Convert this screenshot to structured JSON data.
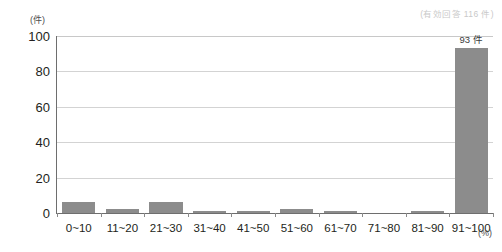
{
  "note": {
    "valid_responses": "(有効回答 116 件)"
  },
  "axes": {
    "y_unit": "(件)",
    "x_unit": "(%)"
  },
  "chart_data": {
    "type": "bar",
    "title": "",
    "subtitle": "",
    "xlabel": "(%)",
    "ylabel": "(件)",
    "categories": [
      "0~10",
      "11~20",
      "21~30",
      "31~40",
      "41~50",
      "51~60",
      "61~70",
      "71~80",
      "81~90",
      "91~100"
    ],
    "values": [
      6,
      2,
      6,
      1,
      1,
      2,
      1,
      0,
      1,
      93
    ],
    "value_labels": [
      "",
      "",
      "",
      "",
      "",
      "",
      "",
      "",
      "",
      "93 件"
    ],
    "ylim": [
      0,
      100
    ],
    "ytick_labels": [
      "0",
      "20",
      "40",
      "60",
      "80",
      "100"
    ],
    "yticks": [
      0,
      20,
      40,
      60,
      80,
      100
    ],
    "grid": true,
    "legend": null,
    "bar_color": "#8c8c8c",
    "annotations": [
      "(有効回答 116 件)"
    ]
  }
}
